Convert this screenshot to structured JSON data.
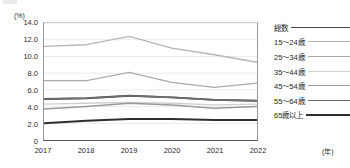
{
  "chart_data": {
    "type": "line",
    "title": "",
    "subtitle": "",
    "xlabel": "年",
    "ylabel": "%",
    "y_unit_label": "(%)",
    "x_unit_label": "(年)",
    "x": [
      "2017",
      "2018",
      "2019",
      "2020",
      "2021",
      "2022"
    ],
    "xlim": [
      2017,
      2022
    ],
    "ylim": [
      0,
      14.0
    ],
    "yticks": [
      "0",
      "2.0",
      "4.0",
      "6.0",
      "8.0",
      "10.0",
      "12.0",
      "14.0"
    ],
    "ytick_values": [
      0,
      2.0,
      4.0,
      6.0,
      8.0,
      10.0,
      12.0,
      14.0
    ],
    "grid": true,
    "grid_axis": "y",
    "legend_position": "right",
    "series": [
      {
        "name": "総数",
        "color": "#4a4a4a",
        "width": 1.9,
        "values": [
          4.9,
          5.0,
          5.3,
          5.1,
          4.8,
          4.7
        ]
      },
      {
        "name": "15～24歳",
        "color": "#b5b5b5",
        "width": 1.3,
        "values": [
          11.2,
          11.4,
          12.4,
          11.0,
          10.2,
          9.3
        ]
      },
      {
        "name": "25～34歳",
        "color": "#ababab",
        "width": 1.3,
        "values": [
          7.1,
          7.1,
          8.1,
          6.9,
          6.3,
          6.8
        ]
      },
      {
        "name": "35～44歳",
        "color": "#cfcfcf",
        "width": 1.3,
        "values": [
          4.3,
          4.4,
          4.5,
          4.4,
          4.2,
          4.3
        ]
      },
      {
        "name": "45～54歳",
        "color": "#9a9a9a",
        "width": 1.5,
        "values": [
          3.7,
          4.0,
          4.4,
          4.2,
          3.8,
          4.0
        ]
      },
      {
        "name": "55～64歳",
        "color": "#6e6e6e",
        "width": 1.6,
        "values": [
          4.9,
          5.0,
          5.3,
          5.1,
          4.8,
          4.7
        ]
      },
      {
        "name": "65歳以上",
        "color": "#2e2e2e",
        "width": 2.0,
        "values": [
          2.0,
          2.3,
          2.5,
          2.5,
          2.4,
          2.4
        ]
      }
    ]
  }
}
